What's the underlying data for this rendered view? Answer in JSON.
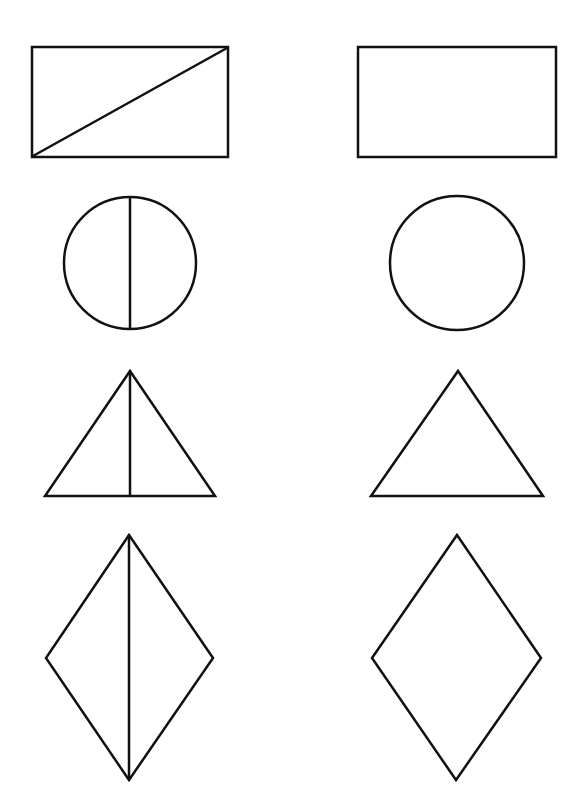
{
  "figure": {
    "stroke_color": "#111111",
    "background_color": "#ffffff",
    "rows": [
      {
        "shape": "rectangle",
        "left": {
          "divided": true,
          "divider": "diagonal",
          "x": 32,
          "y": 47,
          "w": 196,
          "h": 110
        },
        "right": {
          "divided": false,
          "x": 358,
          "y": 47,
          "w": 198,
          "h": 110
        }
      },
      {
        "shape": "circle",
        "left": {
          "divided": true,
          "divider": "vertical",
          "cx": 130,
          "cy": 263,
          "r": 66
        },
        "right": {
          "divided": false,
          "cx": 457,
          "cy": 263,
          "r": 67
        }
      },
      {
        "shape": "triangle",
        "left": {
          "divided": true,
          "divider": "vertical-median",
          "points": "130,371 45,496 215,496"
        },
        "right": {
          "divided": false,
          "points": "458,371 371,496 543,496"
        }
      },
      {
        "shape": "rhombus",
        "left": {
          "divided": true,
          "divider": "vertical",
          "points": "129,535 213,658 129,780 46,658"
        },
        "right": {
          "divided": false,
          "points": "457,535 541,658 456,780 372,658"
        }
      }
    ]
  }
}
